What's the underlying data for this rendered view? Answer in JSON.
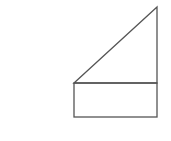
{
  "diagram": {
    "title": "",
    "stroke_color": "#555555",
    "stroke_width": 1.3,
    "background": "#ffffff",
    "shapes": [
      {
        "id": "triangle",
        "type": "polygon",
        "points": [
          [
            74,
            83
          ],
          [
            157,
            7
          ],
          [
            157,
            83
          ]
        ]
      },
      {
        "id": "rectangle",
        "type": "rect",
        "x": 74,
        "y": 83,
        "width": 83,
        "height": 34
      }
    ]
  }
}
